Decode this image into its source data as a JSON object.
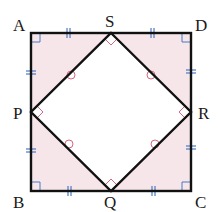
{
  "diagram": {
    "title": "",
    "colors": {
      "outline": "#111111",
      "fill_corner": "#f6e6ea",
      "fill_inner": "#ffffff",
      "tick": "#4a78c2",
      "inner_mark": "#d9667e"
    },
    "outer_square": {
      "vertices": [
        {
          "label": "A",
          "x": 31,
          "y": 33,
          "lx": 13,
          "ly": 31
        },
        {
          "label": "D",
          "x": 191,
          "y": 33,
          "lx": 196,
          "ly": 31
        },
        {
          "label": "C",
          "x": 191,
          "y": 191,
          "lx": 196,
          "ly": 209
        },
        {
          "label": "B",
          "x": 31,
          "y": 191,
          "lx": 13,
          "ly": 209
        }
      ]
    },
    "inner_square": {
      "vertices": [
        {
          "label": "S",
          "x": 111,
          "y": 33,
          "lx": 104,
          "ly": 25
        },
        {
          "label": "R",
          "x": 191,
          "y": 112,
          "lx": 197,
          "ly": 119
        },
        {
          "label": "Q",
          "x": 111,
          "y": 191,
          "lx": 104,
          "ly": 209
        },
        {
          "label": "P",
          "x": 31,
          "y": 112,
          "lx": 13,
          "ly": 119
        }
      ]
    },
    "markings": {
      "outer_right_angles": [
        "A",
        "B",
        "C",
        "D"
      ],
      "inner_right_angles": [
        "S",
        "R",
        "Q",
        "P"
      ],
      "equal_segments_double_tick": [
        "AS",
        "SD",
        "DR",
        "RC",
        "CQ",
        "QB",
        "BP",
        "PA"
      ],
      "equal_angle_circles": [
        "PS",
        "SR",
        "RQ",
        "QP"
      ]
    }
  }
}
